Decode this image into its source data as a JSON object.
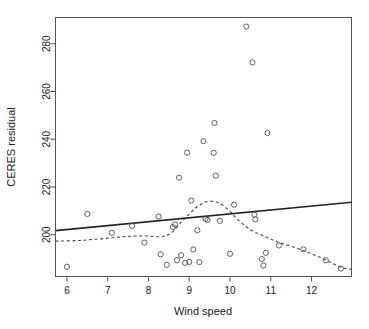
{
  "chart_data": {
    "type": "scatter",
    "title": "",
    "xlabel": "Wind speed",
    "ylabel": "CERES residual",
    "xlim": [
      5.72,
      12.98
    ],
    "ylim": [
      182.5,
      291.0
    ],
    "xticks": [
      6,
      7,
      8,
      9,
      10,
      11,
      12
    ],
    "yticks": [
      200,
      220,
      240,
      260,
      280
    ],
    "grid": false,
    "legend": "none",
    "marker": "open-circle",
    "points": [
      {
        "x": 6.0,
        "y": 186.6
      },
      {
        "x": 6.5,
        "y": 208.7
      },
      {
        "x": 7.1,
        "y": 200.8
      },
      {
        "x": 7.6,
        "y": 203.7
      },
      {
        "x": 7.9,
        "y": 196.7
      },
      {
        "x": 8.25,
        "y": 207.6
      },
      {
        "x": 8.3,
        "y": 191.8
      },
      {
        "x": 8.45,
        "y": 187.4
      },
      {
        "x": 8.6,
        "y": 203.2
      },
      {
        "x": 8.65,
        "y": 204.3
      },
      {
        "x": 8.7,
        "y": 189.3
      },
      {
        "x": 8.75,
        "y": 223.9
      },
      {
        "x": 8.8,
        "y": 191.4
      },
      {
        "x": 8.9,
        "y": 188.2
      },
      {
        "x": 8.95,
        "y": 234.4
      },
      {
        "x": 9.0,
        "y": 188.6
      },
      {
        "x": 9.05,
        "y": 214.3
      },
      {
        "x": 9.1,
        "y": 193.8
      },
      {
        "x": 9.2,
        "y": 201.9
      },
      {
        "x": 9.25,
        "y": 188.5
      },
      {
        "x": 9.35,
        "y": 239.2
      },
      {
        "x": 9.4,
        "y": 206.6
      },
      {
        "x": 9.45,
        "y": 206.2
      },
      {
        "x": 9.6,
        "y": 234.3
      },
      {
        "x": 9.62,
        "y": 246.8
      },
      {
        "x": 9.65,
        "y": 224.8
      },
      {
        "x": 9.75,
        "y": 205.8
      },
      {
        "x": 10.0,
        "y": 192.0
      },
      {
        "x": 10.1,
        "y": 212.6
      },
      {
        "x": 10.4,
        "y": 287.2
      },
      {
        "x": 10.55,
        "y": 272.2
      },
      {
        "x": 10.6,
        "y": 208.4
      },
      {
        "x": 10.62,
        "y": 206.4
      },
      {
        "x": 10.78,
        "y": 189.8
      },
      {
        "x": 10.82,
        "y": 187.1
      },
      {
        "x": 10.88,
        "y": 192.4
      },
      {
        "x": 10.92,
        "y": 242.6
      },
      {
        "x": 11.2,
        "y": 195.5
      },
      {
        "x": 11.8,
        "y": 193.9
      },
      {
        "x": 12.35,
        "y": 189.3
      },
      {
        "x": 12.72,
        "y": 185.8
      }
    ],
    "fit_line": {
      "style": "solid",
      "label": "least-squares line",
      "x": [
        5.72,
        12.98
      ],
      "y": [
        201.7,
        213.6
      ]
    },
    "lowess_line": {
      "style": "dashed",
      "label": "lowess smooth",
      "x": [
        5.72,
        6.3,
        6.9,
        7.5,
        7.9,
        8.3,
        8.55,
        8.8,
        9.0,
        9.2,
        9.45,
        9.7,
        9.95,
        10.2,
        10.5,
        10.8,
        11.2,
        11.7,
        12.2,
        12.72,
        12.98
      ],
      "y": [
        197.3,
        197.6,
        198.4,
        199.3,
        199.5,
        199.2,
        200.6,
        205.2,
        208.6,
        211.8,
        213.9,
        213.5,
        210.6,
        206.2,
        202.1,
        199.7,
        196.8,
        194.0,
        190.6,
        186.4,
        185.5
      ]
    }
  },
  "axis": {
    "x_title": "Wind speed",
    "y_title": "CERES residual",
    "x_tick_labels": [
      "6",
      "7",
      "8",
      "9",
      "10",
      "11",
      "12"
    ],
    "y_tick_labels": [
      "200",
      "220",
      "240",
      "260",
      "280"
    ]
  },
  "colors": {
    "background": "#ffffff",
    "frame": "#555555",
    "point": "#4d4d4d",
    "fit_line": "#222222",
    "lowess_line": "#444444",
    "text": "#1a1a1a"
  }
}
